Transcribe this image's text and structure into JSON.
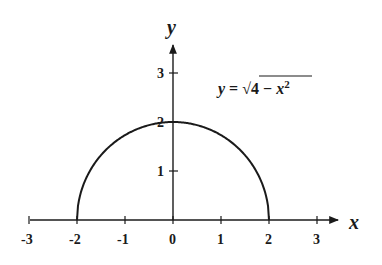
{
  "chart_data": {
    "type": "line",
    "title": "",
    "xlabel": "x",
    "ylabel": "y",
    "xlim": [
      -3,
      3
    ],
    "ylim": [
      0,
      3
    ],
    "grid": false,
    "legend": null,
    "x_ticks": [
      -3,
      -2,
      -1,
      0,
      1,
      2,
      3
    ],
    "x_tick_labels": [
      "-3",
      "-2",
      "-1",
      "0",
      "1",
      "2",
      "3"
    ],
    "y_ticks": [
      1,
      2,
      3
    ],
    "y_tick_labels": [
      "1",
      "2",
      "3"
    ],
    "annotations": [
      {
        "text": "y = √(4 − x²)",
        "position": "upper right"
      }
    ],
    "series": [
      {
        "name": "y = sqrt(4 - x^2)",
        "function": "sqrt(4 - x^2)",
        "x": [
          -2,
          -1.5,
          -1,
          -0.5,
          0,
          0.5,
          1,
          1.5,
          2
        ],
        "y": [
          0,
          1.32,
          1.73,
          1.94,
          2,
          1.94,
          1.73,
          1.32,
          0
        ],
        "color": "#1a1a1a"
      }
    ]
  },
  "labels": {
    "x_axis": "x",
    "y_axis": "y",
    "equation_lhs": "y",
    "equation_eq": " = ",
    "equation_radical": "√",
    "equation_radicand_const": "4 − ",
    "equation_radicand_var": "x",
    "equation_exponent": "2"
  },
  "colors": {
    "ink": "#1a1a1a",
    "background": "#ffffff"
  }
}
